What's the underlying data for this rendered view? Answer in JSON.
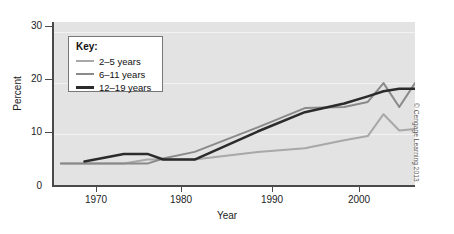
{
  "chart_data": {
    "type": "line",
    "title": "",
    "xlabel": "Year",
    "ylabel": "Percent",
    "xlim": [
      1962,
      2008
    ],
    "ylim": [
      0,
      32
    ],
    "xticks": [
      1970,
      1980,
      1990,
      2000
    ],
    "xtick_labels": [
      "1970",
      "1980",
      "1990",
      "2000"
    ],
    "yticks": [
      0,
      10,
      20,
      30
    ],
    "ytick_labels": [
      "0",
      "10",
      "20",
      "30"
    ],
    "grid": true,
    "legend_position": "upper-left-inside",
    "legend_title": "Key:",
    "series": [
      {
        "name": "2–5 years",
        "color": "#a8a8a8",
        "width": 2,
        "x": [
          1963,
          1971,
          1974,
          1976,
          1980,
          1988,
          1994,
          1999,
          2002,
          2004,
          2006,
          2008
        ],
        "values": [
          4.2,
          4.2,
          5.0,
          5.0,
          5.0,
          6.5,
          7.2,
          8.8,
          9.6,
          13.9,
          10.7,
          11.0
        ]
      },
      {
        "name": "6–11 years",
        "color": "#8a8a8a",
        "width": 2,
        "x": [
          1963,
          1971,
          1974,
          1976,
          1980,
          1988,
          1994,
          1999,
          2002,
          2004,
          2006,
          2008
        ],
        "values": [
          4.2,
          4.2,
          4.2,
          5.2,
          6.5,
          11.3,
          15.1,
          15.3,
          16.3,
          20.0,
          15.3,
          20.0
        ]
      },
      {
        "name": "12–19 years",
        "color": "#2b2b2b",
        "width": 2.5,
        "x": [
          1966,
          1971,
          1974,
          1976,
          1980,
          1988,
          1994,
          1999,
          2002,
          2004,
          2006,
          2008
        ],
        "values": [
          4.6,
          6.1,
          6.1,
          5.0,
          5.0,
          10.5,
          14.3,
          16.0,
          17.4,
          18.4,
          18.9,
          18.9
        ]
      }
    ]
  },
  "credit": "© Cengage Learning 2013"
}
